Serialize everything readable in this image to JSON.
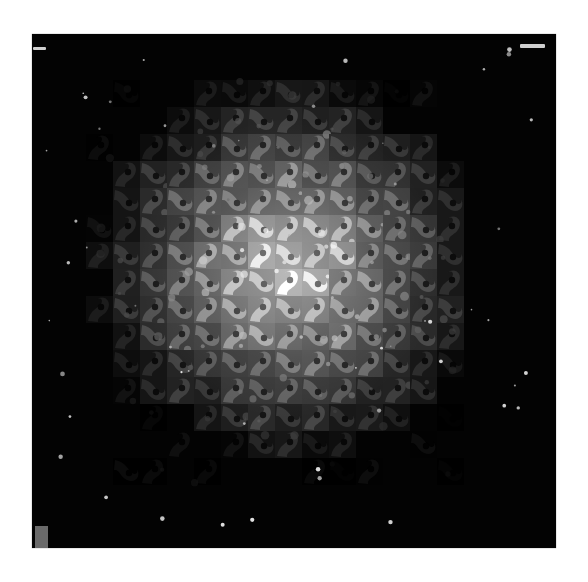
{
  "image": {
    "description": "Grayscale quilt-like tessellation of interlocking swirl tiles on a black square, brightest at center and fading into darkness toward the edges",
    "background_color": "#ffffff",
    "frame": {
      "x": 32,
      "y": 34,
      "width": 524,
      "height": 514,
      "color": "#030303"
    },
    "tile_grid": {
      "origin_x": 86,
      "origin_y": 80,
      "tile_size": 27,
      "cols": 14,
      "rows": 15,
      "center_x": 290,
      "center_y": 268,
      "max_brightness": 215,
      "falloff_radius": 215
    },
    "marks": [
      {
        "name": "top-left-mark",
        "x": 33,
        "y": 47,
        "width": 13,
        "height": 3
      },
      {
        "name": "top-right-mark",
        "x": 520,
        "y": 44,
        "width": 25,
        "height": 4
      }
    ],
    "corner_square": {
      "x": 35,
      "y": 526,
      "width": 13,
      "height": 22,
      "color": "#6a6a6a"
    },
    "speckle_count": 60
  }
}
